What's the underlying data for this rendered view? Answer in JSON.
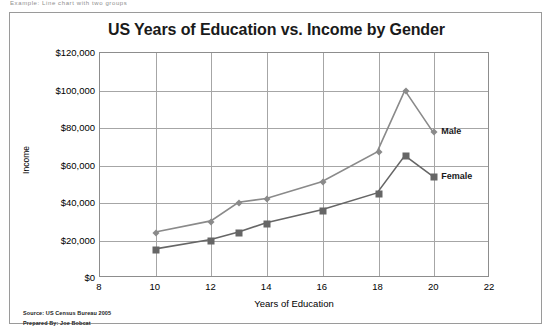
{
  "top_sliver_text": "Example:  Line chart with two groups",
  "chart_data": {
    "type": "line",
    "title": "US Years of Education vs. Income by Gender",
    "xlabel": "Years of Education",
    "ylabel": "Income",
    "xlim": [
      8,
      22
    ],
    "ylim": [
      0,
      120000
    ],
    "xticks": [
      8,
      10,
      12,
      14,
      16,
      18,
      20,
      22
    ],
    "xtick_labels": [
      "8",
      "10",
      "12",
      "14",
      "16",
      "18",
      "20",
      "22"
    ],
    "yticks": [
      0,
      20000,
      40000,
      60000,
      80000,
      100000,
      120000
    ],
    "ytick_labels": [
      "$0",
      "$20,000",
      "$40,000",
      "$60,000",
      "$80,000",
      "$100,000",
      "$120,000"
    ],
    "grid": true,
    "legend_position": "inline-right",
    "series": [
      {
        "name": "Male",
        "marker": "diamond",
        "color": "#8a8a8a",
        "x": [
          10,
          12,
          13,
          14,
          16,
          18,
          19,
          20
        ],
        "values": [
          24000,
          30000,
          40000,
          42000,
          51000,
          67000,
          100000,
          78000
        ]
      },
      {
        "name": "Female",
        "marker": "square",
        "color": "#666666",
        "x": [
          10,
          12,
          13,
          14,
          16,
          18,
          19,
          20
        ],
        "values": [
          15000,
          20000,
          24000,
          29000,
          36000,
          45000,
          65000,
          54000
        ]
      }
    ]
  },
  "footnotes": [
    "Source: US Census Bureau  2005",
    "Prepared  By: Joe Bobcat"
  ]
}
